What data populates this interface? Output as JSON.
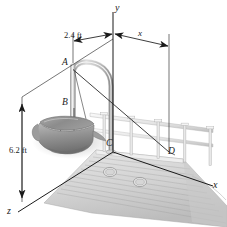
{
  "figure": {
    "kind": "engineering-mechanics-free-body-diagram",
    "background_color": "#ffffff",
    "line_color": "#1a1a1a",
    "metal_light": "#f2f2f2",
    "metal_mid": "#cfcfcf",
    "metal_dark": "#9a9a9a",
    "deck_color": "#d8d8d8",
    "bucket_color": "#8e8e8e"
  },
  "axes": {
    "y_label": "y",
    "x_label": "x",
    "z_label": "z"
  },
  "dimensions": {
    "horizontal_left": "2.4 ft",
    "horizontal_right": "x",
    "vertical_left": "6.2 ft"
  },
  "points": {
    "a": "A",
    "b": "B",
    "c": "C",
    "d": "D"
  }
}
